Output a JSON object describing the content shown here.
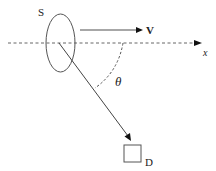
{
  "diagram": {
    "labels": {
      "source": "S",
      "velocity": "V",
      "axis": "x",
      "angle": "θ",
      "detector": "D"
    },
    "colors": {
      "stroke": "#555555",
      "text": "#222222",
      "velocity_arrow": "#8a8a8a",
      "background": "#ffffff"
    },
    "elements": [
      {
        "id": "source-ellipse",
        "label": "S",
        "shape": "ellipse"
      },
      {
        "id": "velocity-arrow",
        "label": "V",
        "direction": "right"
      },
      {
        "id": "x-axis",
        "label": "x",
        "style": "dashed",
        "direction": "right"
      },
      {
        "id": "ray-to-detector",
        "from": "S",
        "to": "D"
      },
      {
        "id": "angle-arc",
        "label": "θ",
        "style": "dashed"
      },
      {
        "id": "detector-box",
        "label": "D",
        "shape": "square"
      }
    ]
  }
}
